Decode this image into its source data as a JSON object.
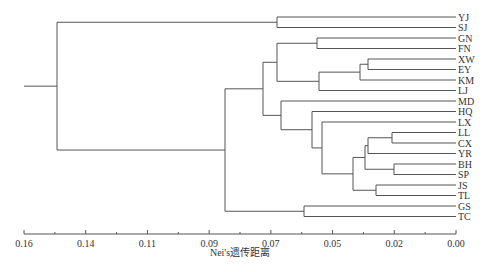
{
  "chart_data": {
    "type": "dendrogram",
    "title": "",
    "xlabel": "Nei's遗传距离",
    "ylabel": "",
    "xlim": [
      0.16,
      0.0
    ],
    "x_ticks": [
      "0.16",
      "0.14",
      "0.11",
      "0.09",
      "0.07",
      "0.05",
      "0.02",
      "0.00"
    ],
    "leaves": [
      "YJ",
      "SJ",
      "GN",
      "FN",
      "XW",
      "EY",
      "KM",
      "LJ",
      "MD",
      "HQ",
      "LX",
      "LL",
      "CX",
      "YR",
      "BH",
      "SP",
      "JS",
      "TL",
      "GS",
      "TC"
    ],
    "merges": [
      {
        "children": [
          "XW",
          "EY"
        ],
        "distance": 0.033
      },
      {
        "children": [
          "LL",
          "CX"
        ],
        "distance": 0.022
      },
      {
        "children": [
          "BH",
          "SP"
        ],
        "distance": 0.021
      },
      {
        "children": [
          "JS",
          "TL"
        ],
        "distance": 0.029
      },
      {
        "children": [
          "XW-EY",
          "KM"
        ],
        "distance": 0.035
      },
      {
        "children": [
          "LL-CX",
          "YR"
        ],
        "distance": 0.035
      },
      {
        "children": [
          "LL-CX-YR",
          "BH-SP"
        ],
        "distance": 0.036
      },
      {
        "children": [
          "LL..SP",
          "JS-TL"
        ],
        "distance": 0.04
      },
      {
        "children": [
          "GN",
          "FN"
        ],
        "distance": 0.051
      },
      {
        "children": [
          "XW..KM",
          "LJ"
        ],
        "distance": 0.05
      },
      {
        "children": [
          "LX",
          "LL..TL"
        ],
        "distance": 0.05
      },
      {
        "children": [
          "HQ",
          "LX..TL"
        ],
        "distance": 0.053
      },
      {
        "children": [
          "GN-FN",
          "XW..LJ"
        ],
        "distance": 0.065
      },
      {
        "children": [
          "YJ",
          "SJ"
        ],
        "distance": 0.065
      },
      {
        "children": [
          "MD",
          "HQ..TL"
        ],
        "distance": 0.064
      },
      {
        "children": [
          "GS",
          "TC"
        ],
        "distance": 0.056
      },
      {
        "children": [
          "GN..LJ",
          "MD..TL"
        ],
        "distance": 0.07
      },
      {
        "children": [
          "GN..TL",
          "GS-TC"
        ],
        "distance": 0.085
      },
      {
        "children": [
          "YJ-SJ",
          "GN..TC"
        ],
        "distance": 0.148
      }
    ],
    "grid": false,
    "legend": null
  }
}
